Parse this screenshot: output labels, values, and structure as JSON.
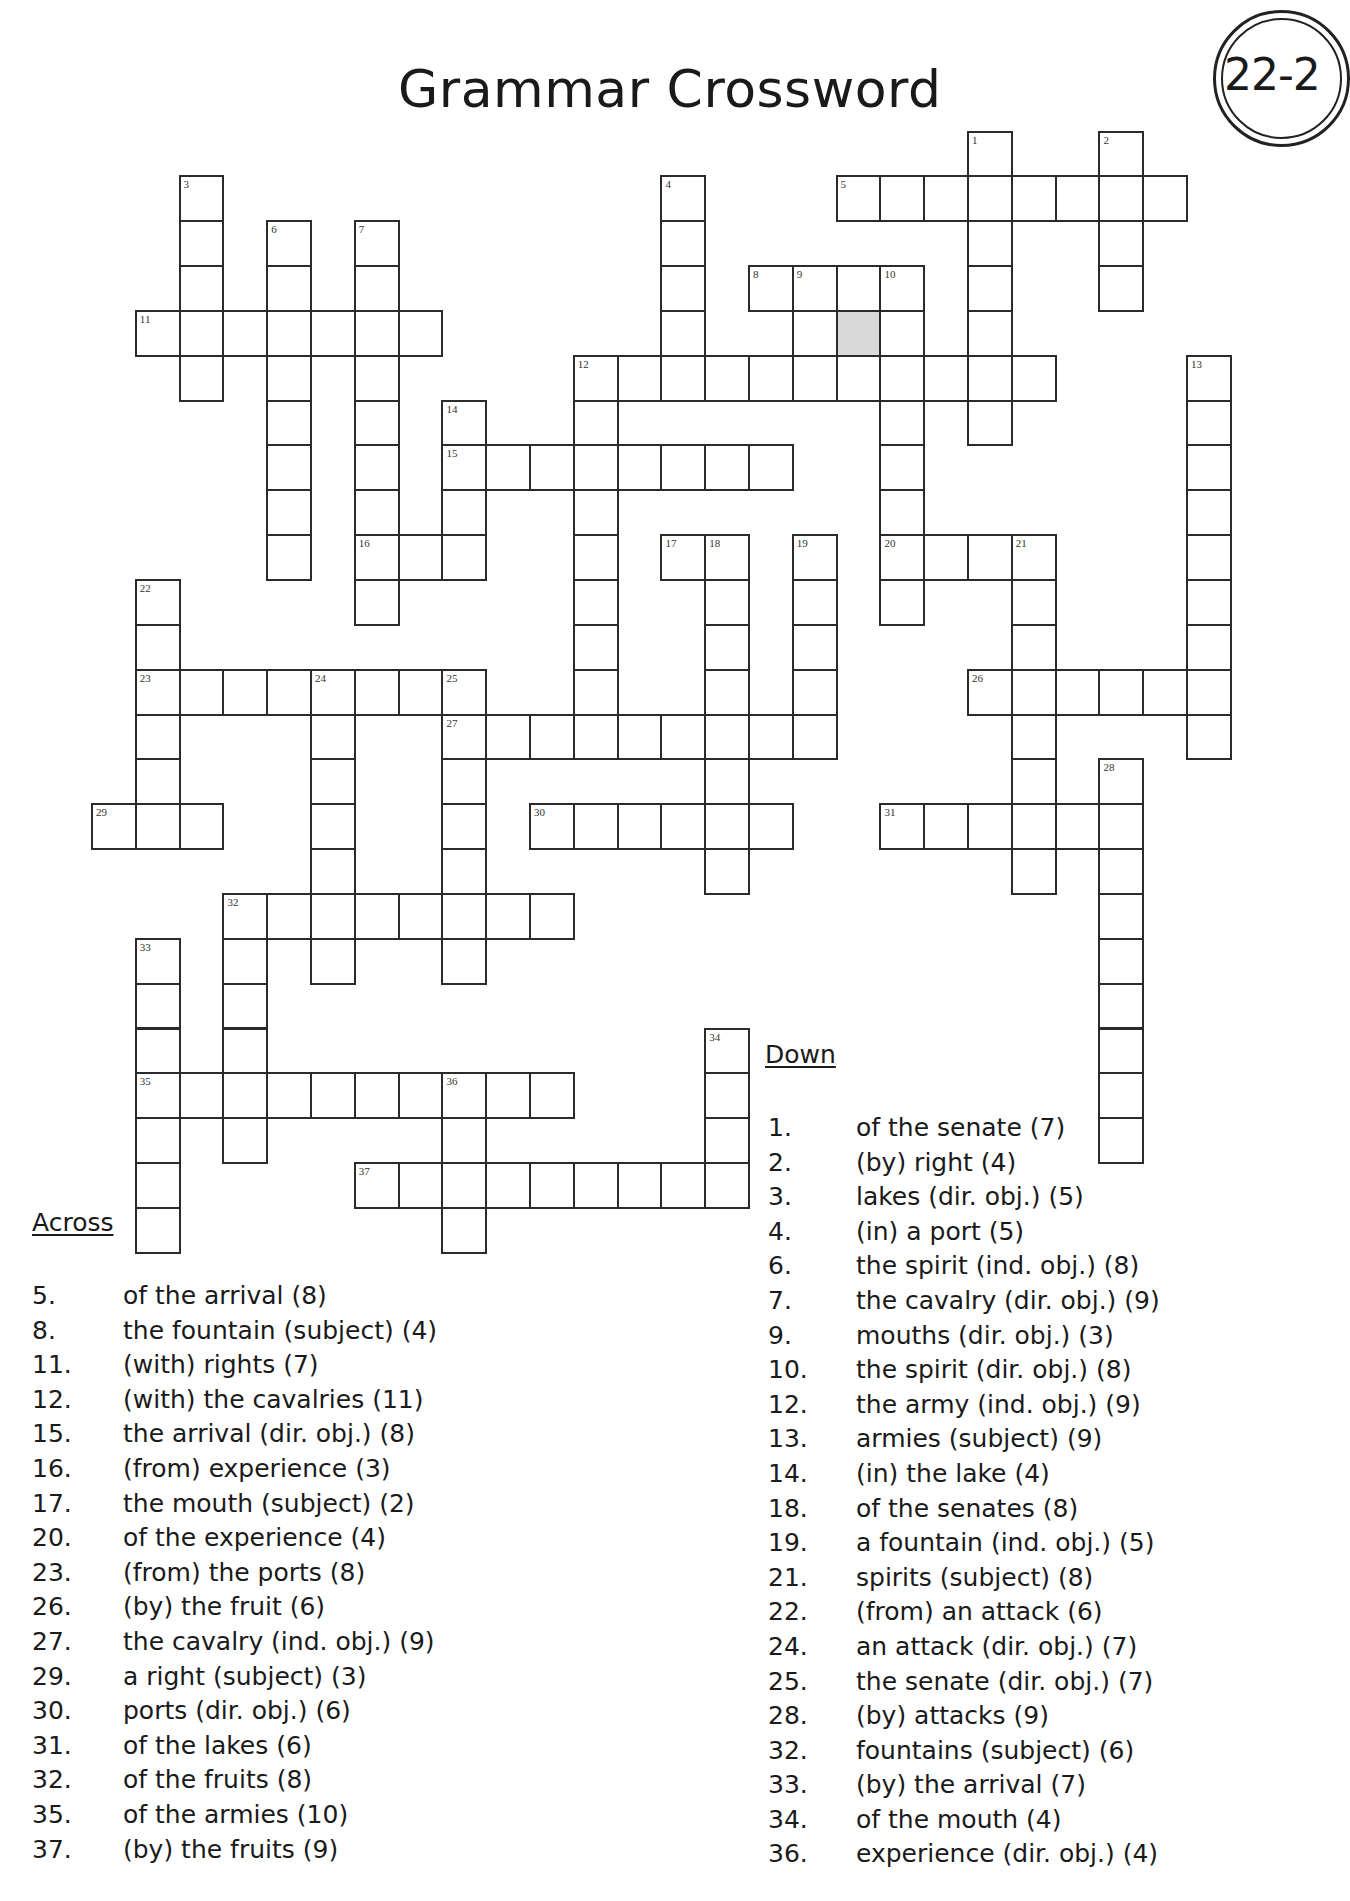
{
  "page": {
    "title": "Grammar Crossword",
    "badge": "22-2"
  },
  "grid_geometry": {
    "col_origin": 91,
    "col_pitch": 43.8,
    "row_origin": 130.5,
    "row_pitch": 44.85
  },
  "entries": [
    {
      "num": 1,
      "dir": "down",
      "col": 20,
      "row": 0,
      "len": 7
    },
    {
      "num": 2,
      "dir": "down",
      "col": 23,
      "row": 0,
      "len": 4
    },
    {
      "num": 3,
      "dir": "down",
      "col": 2,
      "row": 1,
      "len": 5
    },
    {
      "num": 4,
      "dir": "down",
      "col": 13,
      "row": 1,
      "len": 5
    },
    {
      "num": 5,
      "dir": "across",
      "col": 17,
      "row": 1,
      "len": 8
    },
    {
      "num": 6,
      "dir": "down",
      "col": 4,
      "row": 2,
      "len": 8
    },
    {
      "num": 7,
      "dir": "down",
      "col": 6,
      "row": 2,
      "len": 9
    },
    {
      "num": 8,
      "dir": "across",
      "col": 15,
      "row": 3,
      "len": 4
    },
    {
      "num": 9,
      "dir": "down",
      "col": 16,
      "row": 3,
      "len": 3
    },
    {
      "num": 10,
      "dir": "down",
      "col": 18,
      "row": 3,
      "len": 8
    },
    {
      "num": 11,
      "dir": "across",
      "col": 1,
      "row": 4,
      "len": 7
    },
    {
      "num": 12,
      "dir": "across",
      "col": 11,
      "row": 5,
      "len": 11
    },
    {
      "num": 12,
      "dir": "down",
      "col": 11,
      "row": 5,
      "len": 9
    },
    {
      "num": 13,
      "dir": "down",
      "col": 25,
      "row": 5,
      "len": 9
    },
    {
      "num": 14,
      "dir": "down",
      "col": 8,
      "row": 6,
      "len": 4
    },
    {
      "num": 15,
      "dir": "across",
      "col": 8,
      "row": 7,
      "len": 8
    },
    {
      "num": 16,
      "dir": "across",
      "col": 6,
      "row": 9,
      "len": 3
    },
    {
      "num": 17,
      "dir": "across",
      "col": 13,
      "row": 9,
      "len": 2
    },
    {
      "num": 18,
      "dir": "down",
      "col": 14,
      "row": 9,
      "len": 8
    },
    {
      "num": 19,
      "dir": "down",
      "col": 16,
      "row": 9,
      "len": 5
    },
    {
      "num": 20,
      "dir": "across",
      "col": 18,
      "row": 9,
      "len": 4
    },
    {
      "num": 21,
      "dir": "down",
      "col": 21,
      "row": 9,
      "len": 8
    },
    {
      "num": 22,
      "dir": "down",
      "col": 1,
      "row": 10,
      "len": 6
    },
    {
      "num": 23,
      "dir": "across",
      "col": 1,
      "row": 12,
      "len": 8
    },
    {
      "num": 24,
      "dir": "down",
      "col": 5,
      "row": 12,
      "len": 7
    },
    {
      "num": 25,
      "dir": "down",
      "col": 8,
      "row": 12,
      "len": 7
    },
    {
      "num": 26,
      "dir": "across",
      "col": 20,
      "row": 12,
      "len": 6
    },
    {
      "num": 27,
      "dir": "across",
      "col": 8,
      "row": 13,
      "len": 9
    },
    {
      "num": 28,
      "dir": "down",
      "col": 23,
      "row": 14,
      "len": 9
    },
    {
      "num": 29,
      "dir": "across",
      "col": 0,
      "row": 15,
      "len": 3
    },
    {
      "num": 30,
      "dir": "across",
      "col": 10,
      "row": 15,
      "len": 6
    },
    {
      "num": 31,
      "dir": "across",
      "col": 18,
      "row": 15,
      "len": 6
    },
    {
      "num": 32,
      "dir": "across",
      "col": 3,
      "row": 17,
      "len": 8
    },
    {
      "num": 32,
      "dir": "down",
      "col": 3,
      "row": 17,
      "len": 6
    },
    {
      "num": 33,
      "dir": "down",
      "col": 1,
      "row": 18,
      "len": 7
    },
    {
      "num": 34,
      "dir": "down",
      "col": 14,
      "row": 20,
      "len": 4
    },
    {
      "num": 35,
      "dir": "across",
      "col": 1,
      "row": 21,
      "len": 10
    },
    {
      "num": 36,
      "dir": "down",
      "col": 8,
      "row": 21,
      "len": 4
    },
    {
      "num": 37,
      "dir": "across",
      "col": 6,
      "row": 23,
      "len": 9
    }
  ],
  "shaded_cells": [
    {
      "col": 17,
      "row": 4
    }
  ],
  "across": {
    "heading": "Across",
    "clues": [
      {
        "num": "5.",
        "text": "of the arrival  (8)"
      },
      {
        "num": "8.",
        "text": "the fountain (subject)  (4)"
      },
      {
        "num": "11.",
        "text": "(with) rights  (7)"
      },
      {
        "num": "12.",
        "text": "(with) the cavalries  (11)"
      },
      {
        "num": "15.",
        "text": "the arrival (dir. obj.)  (8)"
      },
      {
        "num": "16.",
        "text": "(from) experience  (3)"
      },
      {
        "num": "17.",
        "text": "the mouth (subject)  (2)"
      },
      {
        "num": "20.",
        "text": "of the experience  (4)"
      },
      {
        "num": "23.",
        "text": "(from) the ports  (8)"
      },
      {
        "num": "26.",
        "text": "(by) the fruit  (6)"
      },
      {
        "num": "27.",
        "text": "the cavalry (ind. obj.)  (9)"
      },
      {
        "num": "29.",
        "text": "a right (subject)  (3)"
      },
      {
        "num": "30.",
        "text": "ports (dir. obj.)  (6)"
      },
      {
        "num": "31.",
        "text": "of the lakes  (6)"
      },
      {
        "num": "32.",
        "text": "of the fruits  (8)"
      },
      {
        "num": "35.",
        "text": "of the armies  (10)"
      },
      {
        "num": "37.",
        "text": "(by) the fruits  (9)"
      }
    ]
  },
  "down": {
    "heading": "Down",
    "clues": [
      {
        "num": "1.",
        "text": "of the senate  (7)"
      },
      {
        "num": "2.",
        "text": "(by) right  (4)"
      },
      {
        "num": "3.",
        "text": "lakes (dir. obj.)  (5)"
      },
      {
        "num": "4.",
        "text": "(in) a port  (5)"
      },
      {
        "num": "6.",
        "text": "the spirit (ind. obj.)  (8)"
      },
      {
        "num": "7.",
        "text": "the cavalry (dir. obj.)  (9)"
      },
      {
        "num": "9.",
        "text": "mouths (dir. obj.)  (3)"
      },
      {
        "num": "10.",
        "text": "the spirit (dir. obj.)  (8)"
      },
      {
        "num": "12.",
        "text": "the army (ind. obj.)  (9)"
      },
      {
        "num": "13.",
        "text": "armies (subject)  (9)"
      },
      {
        "num": "14.",
        "text": "(in) the lake  (4)"
      },
      {
        "num": "18.",
        "text": "of the senates  (8)"
      },
      {
        "num": "19.",
        "text": "a fountain (ind. obj.)  (5)"
      },
      {
        "num": "21.",
        "text": "spirits (subject)  (8)"
      },
      {
        "num": "22.",
        "text": "(from) an attack  (6)"
      },
      {
        "num": "24.",
        "text": "an attack (dir. obj.)  (7)"
      },
      {
        "num": "25.",
        "text": "the senate (dir. obj.)  (7)"
      },
      {
        "num": "28.",
        "text": "(by) attacks  (9)"
      },
      {
        "num": "32.",
        "text": "fountains (subject)  (6)"
      },
      {
        "num": "33.",
        "text": "(by) the arrival  (7)"
      },
      {
        "num": "34.",
        "text": "of the mouth  (4)"
      },
      {
        "num": "36.",
        "text": "experience (dir. obj.)  (4)"
      }
    ]
  },
  "colors": {
    "line": "#2b2b2b",
    "shaded": "#d9d9d9",
    "text": "#1a1a1a"
  }
}
